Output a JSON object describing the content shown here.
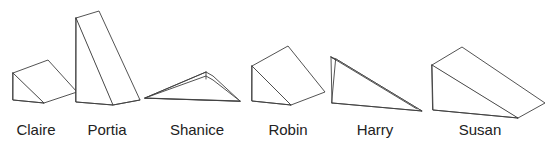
{
  "figure": {
    "type": "line-drawing",
    "background_color": "#ffffff",
    "stroke_color": "#3f3f3f",
    "fill_color": "#ffffff",
    "item_count": 6
  },
  "items": [
    {
      "id": "claire",
      "label": "Claire",
      "label_x": 36,
      "label_y": 122,
      "orientation": "small wedge, rising to the right, seen from above-left",
      "faces": {
        "top": "13,73 48,60 77,92 44,103",
        "side": "13,73 44,103 13,100"
      },
      "edges": [
        "13,73 13,100 44,103"
      ]
    },
    {
      "id": "portia",
      "label": "Portia",
      "label_x": 107,
      "label_y": 122,
      "orientation": "tall steep wedge, apex at top, seen from the left",
      "faces": {
        "top": "76,18 99,11 140,100 113,105",
        "side": "76,18 113,105 76,102"
      },
      "edges": [
        "76,18 76,102 113,105 140,100"
      ]
    },
    {
      "id": "shanice",
      "label": "Shanice",
      "label_x": 197,
      "label_y": 122,
      "orientation": "flat low wedge seen nearly edge-on, sharp point to the left",
      "faces": {
        "top": "145,98 206,72 213,76 240,101",
        "side": "145,98 206,76 213,80 240,101"
      },
      "edges": [
        "145,98 206,72",
        "206,72 206,79",
        "145,98 240,101"
      ]
    },
    {
      "id": "robin",
      "label": "Robin",
      "label_x": 288,
      "label_y": 122,
      "orientation": "medium wedge rising to the left, seen from above-left",
      "faces": {
        "top": "252,66 288,46 325,92 291,105",
        "side": "252,66 291,105 252,101"
      },
      "edges": [
        "252,66 252,101 291,105"
      ]
    },
    {
      "id": "harry",
      "label": "Harry",
      "label_x": 375,
      "label_y": 122,
      "orientation": "thin shallow wedge seen nearly edge-on, tapering to the right",
      "faces": {
        "top": "331,57 336,59 422,111 417,109",
        "side": "336,59 422,111 332,103"
      },
      "edges": [
        "331,57 332,103",
        "331,57 417,109",
        "332,103 422,111"
      ]
    },
    {
      "id": "susan",
      "label": "Susan",
      "label_x": 480,
      "label_y": 122,
      "orientation": "large broad wedge sloping down to the right, seen from above-left",
      "faces": {
        "top": "432,65 462,47 545,103 518,118",
        "side": "432,65 518,118 433,110"
      },
      "edges": [
        "432,65 433,110 518,118"
      ]
    }
  ]
}
